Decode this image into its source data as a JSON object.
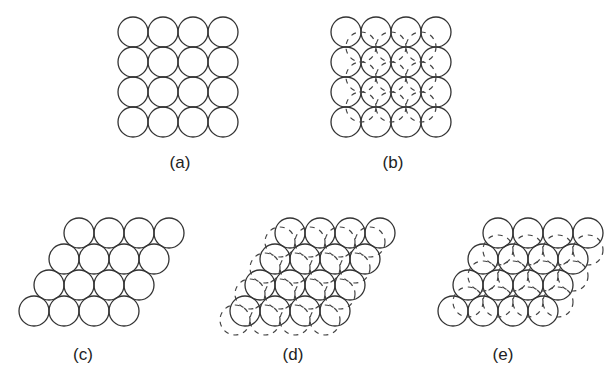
{
  "figure": {
    "panels": [
      {
        "id": "a",
        "label": "(a)",
        "type": "square-layer",
        "rows": 4,
        "cols": 4,
        "second_layer": false,
        "label_pos": [
          180,
          153
        ]
      },
      {
        "id": "b",
        "label": "(b)",
        "type": "square-layer",
        "rows": 4,
        "cols": 4,
        "second_layer": true,
        "label_pos": [
          393,
          153
        ]
      },
      {
        "id": "c",
        "label": "(c)",
        "type": "hexagonal-layer",
        "rows": 4,
        "cols": 4,
        "second_layer": false,
        "label_pos": [
          83,
          345
        ]
      },
      {
        "id": "d",
        "label": "(d)",
        "type": "hexagonal-layer",
        "rows": 4,
        "cols": 4,
        "second_layer": "parallel-offset",
        "label_pos": [
          293,
          345
        ]
      },
      {
        "id": "e",
        "label": "(e)",
        "type": "hexagonal-layer",
        "rows": 4,
        "cols": 4,
        "second_layer": "hollow-sites",
        "label_pos": [
          503,
          345
        ]
      }
    ],
    "colors": {
      "stroke": "#333333",
      "dashed": "#444444",
      "background": "#ffffff"
    }
  }
}
